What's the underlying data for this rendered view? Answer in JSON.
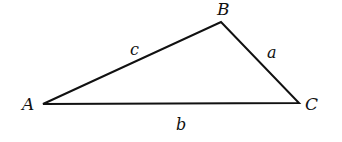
{
  "diagram": {
    "type": "triangle",
    "stroke_color": "#111111",
    "background": "#ffffff",
    "vertices": [
      {
        "name": "A",
        "x": 43,
        "y": 104,
        "label_x": 22,
        "label_y": 110
      },
      {
        "name": "B",
        "x": 221,
        "y": 22,
        "label_x": 217,
        "label_y": 15
      },
      {
        "name": "C",
        "x": 299,
        "y": 103,
        "label_x": 305,
        "label_y": 110
      }
    ],
    "sides": [
      {
        "name": "c",
        "between": "A-B",
        "label_x": 130,
        "label_y": 55
      },
      {
        "name": "a",
        "between": "B-C",
        "label_x": 267,
        "label_y": 58
      },
      {
        "name": "b",
        "between": "A-C",
        "label_x": 176,
        "label_y": 130
      }
    ]
  }
}
